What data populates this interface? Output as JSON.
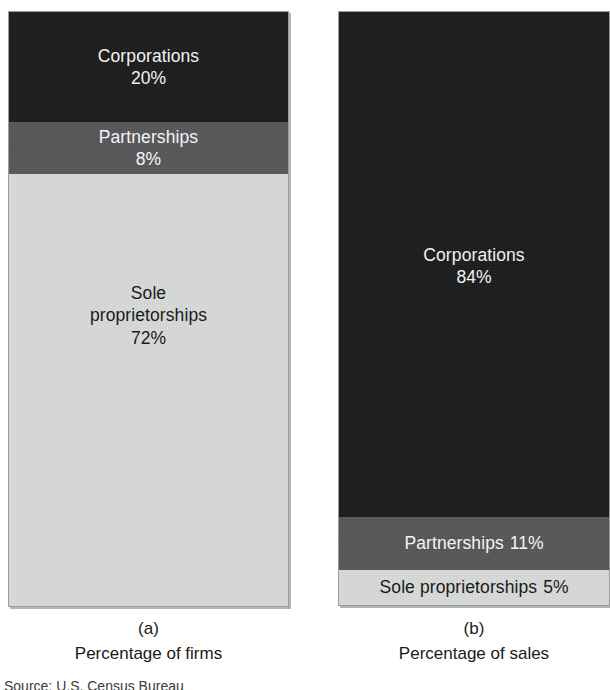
{
  "figure": {
    "source_note": "Source: U.S. Census Bureau",
    "panels": [
      {
        "letter": "(a)",
        "title": "Percentage of firms",
        "segments": [
          {
            "label": "Corporations",
            "value": "20%",
            "percent": 20,
            "color": "#1d1d1d",
            "text_color": "#f2f2f2",
            "layout": "stacked"
          },
          {
            "label": "Partnerships",
            "value": "8%",
            "percent": 8,
            "color": "#58585a",
            "text_color": "#f4f4f4",
            "layout": "stacked"
          },
          {
            "label": "Sole\nproprietorships",
            "value": "72%",
            "percent": 72,
            "color": "#d9dbda",
            "text_color": "#1a1a1a",
            "layout": "stacked"
          }
        ]
      },
      {
        "letter": "(b)",
        "title": "Percentage of sales",
        "segments": [
          {
            "label": "Corporations",
            "value": "84%",
            "percent": 84,
            "color": "#1d1d1d",
            "text_color": "#f2f2f2",
            "layout": "stacked"
          },
          {
            "label": "Partnerships",
            "value": "11%",
            "percent": 11,
            "color": "#58585a",
            "text_color": "#f4f4f4",
            "layout": "inline"
          },
          {
            "label": "Sole proprietorships",
            "value": "5%",
            "percent": 5,
            "color": "#d9dbda",
            "text_color": "#1a1a1a",
            "layout": "inline"
          }
        ]
      }
    ]
  },
  "chart_data": {
    "type": "bar",
    "subtype": "stacked-100-percent",
    "title": "",
    "categories": [
      "Corporations",
      "Partnerships",
      "Sole proprietorships"
    ],
    "charts": [
      {
        "panel": "(a)",
        "title": "Percentage of firms",
        "categories": [
          "Corporations",
          "Partnerships",
          "Sole proprietorships"
        ],
        "values": [
          20,
          8,
          72
        ],
        "unit": "%",
        "ylim": [
          0,
          100
        ]
      },
      {
        "panel": "(b)",
        "title": "Percentage of sales",
        "categories": [
          "Corporations",
          "Partnerships",
          "Sole proprietorships"
        ],
        "values": [
          84,
          11,
          5
        ],
        "unit": "%",
        "ylim": [
          0,
          100
        ]
      }
    ],
    "colors": {
      "corporations": "#1d1d1d",
      "partnerships": "#58585a",
      "sole_proprietorships": "#d9dbda"
    },
    "xlabel": "",
    "ylabel": "",
    "grid": false,
    "legend": "in-segment labels"
  }
}
